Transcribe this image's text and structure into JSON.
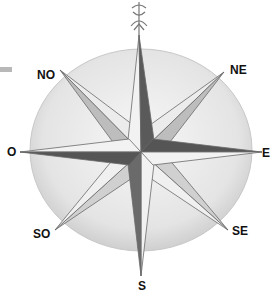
{
  "diagram": {
    "type": "compass-rose",
    "center": [
      141,
      152
    ],
    "labels": {
      "north_marker": "fleur-de-lis-icon",
      "ne": "NE",
      "e": "E",
      "se": "SE",
      "s": "S",
      "so": "SO",
      "o": "O",
      "no": "NO"
    },
    "colors": {
      "circle_fill": "#e6e6e6",
      "point_dark": "#555555",
      "point_light": "#ececec",
      "outline": "#6a6a6a"
    }
  }
}
